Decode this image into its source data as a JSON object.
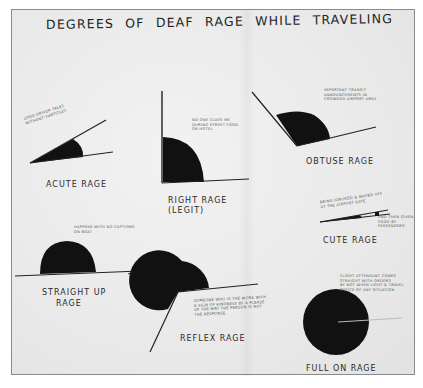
{
  "title": "DEGREES OF DEAF RAGE WHILE TRAVELING",
  "colors": {
    "paper": "#ececec",
    "ink": "#111111",
    "border": "#8a8a8a"
  },
  "angles": [
    {
      "id": "acute",
      "label": "ACUTE RAGE",
      "note": "LOUD DRIVER TALKS\nWITHOUT SUBTITLES"
    },
    {
      "id": "right",
      "label_line1": "RIGHT RAGE",
      "label_line2": "(LEGIT)",
      "note": "NO ONE CLUES ME\nDURING STREET FOOD\nOR HOTEL"
    },
    {
      "id": "obtuse",
      "label": "OBTUSE RAGE",
      "note": "IMPORTANT TRANSIT\nANNOUNCEMENTS IN\nCROWDED AIRPORT AREA"
    },
    {
      "id": "cute",
      "label": "CUTE RAGE",
      "note": "BEING IGNORED & WAVED OFF\nAT THE AIRPORT GATE",
      "note2": "AND THEN GIVEN\nFOOD BY PASSENGERS"
    },
    {
      "id": "straight",
      "label_line1": "STRAIGHT UP",
      "label_line2": "RAGE",
      "note": "HAPPENS WITH NO CAPTIONS\nON BOAT"
    },
    {
      "id": "reflex",
      "label": "REFLEX RAGE",
      "note": "SOMEONE WHO IS THE WORK WITH\nA SIGN OF KINDNESS BY A PLEASE\nOF THE WAY THE PERSON IS NOT\nTHE RESPONSE"
    },
    {
      "id": "full",
      "label": "FULL ON RAGE",
      "note": "FLIGHT ATTENDANT COMES\nSTRAIGHT WITH ORDERS\nBY NOT WHEN LIGHT & TRAVEL\nOFFICE OF ANY SITUATION"
    }
  ]
}
